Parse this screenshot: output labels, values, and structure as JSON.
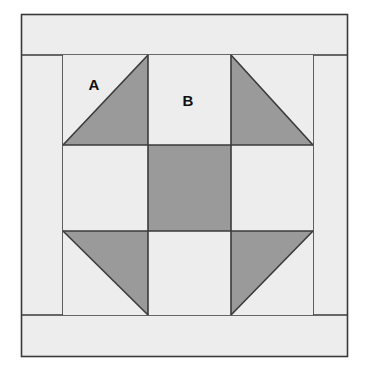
{
  "figure": {
    "type": "quilt-block-diagram",
    "canvas": {
      "width": 367,
      "height": 369,
      "background": "#ffffff"
    }
  },
  "colors": {
    "background": "#ffffff",
    "light_fabric": "#ededed",
    "dark_fabric": "#9a9a9a",
    "outline": "#3a3a3a",
    "label": "#0f0f0f"
  },
  "block": {
    "frame": {
      "x": 21,
      "y": 14,
      "width": 327,
      "height": 343
    },
    "border_bands": [
      {
        "name": "top-border-band",
        "x": 21,
        "y": 14,
        "width": 327,
        "height": 41,
        "fill": "light_fabric"
      },
      {
        "name": "bottom-border-band",
        "x": 21,
        "y": 315,
        "width": 327,
        "height": 42,
        "fill": "light_fabric"
      },
      {
        "name": "left-border-band",
        "x": 21,
        "y": 55,
        "width": 42,
        "height": 260,
        "fill": "light_fabric"
      },
      {
        "name": "right-border-band",
        "x": 313,
        "y": 55,
        "width": 35,
        "height": 260,
        "fill": "light_fabric"
      }
    ],
    "grid": {
      "x": 63,
      "y": 55,
      "width": 250,
      "height": 260,
      "columns": [
        63,
        148,
        231,
        313
      ],
      "rows": [
        55,
        145,
        231,
        315
      ],
      "rows_count": 3,
      "columns_count": 3
    },
    "cells": [
      {
        "name": "cell-top-left",
        "row": 0,
        "col": 0,
        "patch": "half-square-triangle",
        "triangle_corner": "bottom-right",
        "fill": "dark_fabric",
        "base_fill": "light_fabric"
      },
      {
        "name": "cell-top-center",
        "row": 0,
        "col": 1,
        "patch": "square",
        "fill": "light_fabric"
      },
      {
        "name": "cell-top-right",
        "row": 0,
        "col": 2,
        "patch": "half-square-triangle",
        "triangle_corner": "bottom-left",
        "fill": "dark_fabric",
        "base_fill": "light_fabric"
      },
      {
        "name": "cell-middle-left",
        "row": 1,
        "col": 0,
        "patch": "square",
        "fill": "light_fabric"
      },
      {
        "name": "cell-middle-center",
        "row": 1,
        "col": 1,
        "patch": "square",
        "fill": "dark_fabric"
      },
      {
        "name": "cell-middle-right",
        "row": 1,
        "col": 2,
        "patch": "square",
        "fill": "light_fabric"
      },
      {
        "name": "cell-bottom-left",
        "row": 2,
        "col": 0,
        "patch": "half-square-triangle",
        "triangle_corner": "top-right",
        "fill": "dark_fabric",
        "base_fill": "light_fabric"
      },
      {
        "name": "cell-bottom-center",
        "row": 2,
        "col": 1,
        "patch": "square",
        "fill": "light_fabric"
      },
      {
        "name": "cell-bottom-right",
        "row": 2,
        "col": 2,
        "patch": "half-square-triangle",
        "triangle_corner": "top-left",
        "fill": "dark_fabric",
        "base_fill": "light_fabric"
      }
    ],
    "labels": [
      {
        "name": "patch-label-a",
        "text": "A",
        "x": 94,
        "y": 90,
        "refers_to": "cell-top-left"
      },
      {
        "name": "patch-label-b",
        "text": "B",
        "x": 188,
        "y": 106,
        "refers_to": "cell-top-center"
      }
    ]
  }
}
